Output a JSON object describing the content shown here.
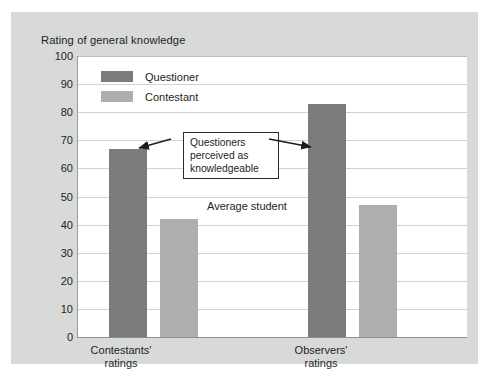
{
  "chart_data": {
    "type": "bar",
    "title": "Rating of general knowledge",
    "xlabel": "",
    "ylabel": "",
    "ylim": [
      0,
      100
    ],
    "ytick_step": 10,
    "yticks": [
      100,
      90,
      80,
      70,
      60,
      50,
      40,
      30,
      20,
      10,
      0
    ],
    "grid": true,
    "legend_position": "inside top-left",
    "categories": [
      "Contestants' ratings",
      "Observers' ratings"
    ],
    "series": [
      {
        "name": "Questioner",
        "color": "#7b7c7e",
        "values": [
          67,
          83
        ]
      },
      {
        "name": "Contestant",
        "color": "#adaeb0",
        "values": [
          42,
          47
        ]
      }
    ],
    "annotations": [
      {
        "name": "callout",
        "text": "Questioners\nperceived as\nknowledgeable",
        "arrows": [
          "points-left-to-questioner-bar-1",
          "points-right-to-questioner-bar-2"
        ]
      },
      {
        "name": "average-student-line-label",
        "text": "Average student"
      }
    ]
  },
  "categories": {
    "0": {
      "line1": "Contestants'",
      "line2": "ratings"
    },
    "1": {
      "line1": "Observers'",
      "line2": "ratings"
    }
  },
  "yticks": {
    "t0": "100",
    "t1": "90",
    "t2": "80",
    "t3": "70",
    "t4": "60",
    "t5": "50",
    "t6": "40",
    "t7": "30",
    "t8": "20",
    "t9": "10",
    "t10": "0"
  },
  "legend": {
    "questioner": "Questioner",
    "contestant": "Contestant"
  },
  "annotation": {
    "callout": "Questioners\nperceived as\nknowledgeable",
    "average_student": "Average student"
  },
  "colors": {
    "questioner": "#7b7c7e",
    "contestant": "#adaeb0",
    "panel": "#d8d9d9",
    "plot": "#ffffff",
    "gridline": "#d0d2d4",
    "text": "#231f20"
  }
}
